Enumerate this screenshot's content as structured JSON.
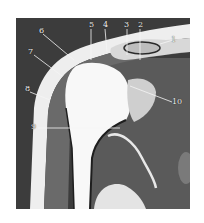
{
  "figure": {
    "type": "coronal MRI of shoulder joint",
    "labels": [
      {
        "id": "1",
        "text": "1",
        "x": 171,
        "y": 36
      },
      {
        "id": "2",
        "text": "2",
        "x": 138,
        "y": 21
      },
      {
        "id": "3",
        "text": "3",
        "x": 124,
        "y": 21
      },
      {
        "id": "4",
        "text": "4",
        "x": 103,
        "y": 21
      },
      {
        "id": "5",
        "text": "5",
        "x": 89,
        "y": 21
      },
      {
        "id": "6",
        "text": "6",
        "x": 39,
        "y": 27
      },
      {
        "id": "7",
        "text": "7",
        "x": 28,
        "y": 48
      },
      {
        "id": "8",
        "text": "8",
        "x": 25,
        "y": 85
      },
      {
        "id": "9",
        "text": "9",
        "x": 31,
        "y": 123
      },
      {
        "id": "10",
        "text": "10",
        "x": 172,
        "y": 98
      }
    ],
    "colors": {
      "background": "#3a3a3a",
      "fat": "#f0f0f0",
      "muscle": "#6e6e6e",
      "bone_marrow": "#fafafa",
      "leader_line": "#f5f5f5"
    }
  }
}
